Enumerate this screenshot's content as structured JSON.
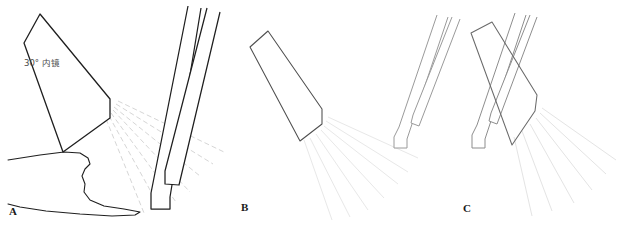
{
  "figure": {
    "background_color": "#ffffff",
    "width": 621,
    "height": 225,
    "ink_color_dark": "#1a1a1a",
    "ink_color_mid": "#5a5a5a",
    "ink_color_light": "#b9b9b9",
    "ray_color": "#d9d9d9",
    "ray_color_faint": "#e6e6e6"
  },
  "panels": {
    "a": {
      "label": "A",
      "annotation": "30° 内镜",
      "annotation_degree_value": "30",
      "annotation_unit": "°",
      "annotation_instrument": "内镜"
    },
    "b": {
      "label": "B"
    },
    "c": {
      "label": "C"
    }
  },
  "geometry": {
    "panel_a": {
      "endoscope_body": "M 40,14 L 110,100 L 110,118 L 62,152 L 24,43 Z",
      "endoscope_edge_left": "M 24,43 L 62,152",
      "endoscope_edge_right": "M 40,14 L 110,100",
      "endoscope_bevel": "M 110,100 L 110,118 L 62,152",
      "instrument_1": "M 188,8 L 150,193 L 150,209 L 168,209 L 168,196 L 200,10",
      "instrument_2": "M 206,10 L 164,172 L 164,183 L 178,184 L 218,14",
      "tissue_outline": "M 8,161 L 44,156 L 70,154 L 86,157 L 90,163 L 86,168 L 83,175 L 86,183 L 85,192 L 92,200 L 106,206 L 128,209 L 140,211 L 136,214 L 118,216 L 84,215 L 50,212 L 22,208 L 8,204",
      "rays": [
        "M 112,108 L 196,178",
        "M 112,110 L 186,192",
        "M 112,112 L 172,200",
        "M 112,114 L 158,206",
        "M 112,116 L 146,212",
        "M 115,106 L 210,166",
        "M 117,104 L 222,156"
      ]
    },
    "panel_b": {
      "endoscope_body": "M 268,31 L 322,110 L 322,125 L 300,140 L 250,47 Z",
      "rays": [
        "M 324,128 L 392,190",
        "M 322,130 L 380,200",
        "M 318,133 L 366,208",
        "M 312,136 L 350,214",
        "M 306,139 L 336,218",
        "M 326,124 L 402,176",
        "M 328,120 L 412,162"
      ]
    },
    "panel_c": {
      "instrument_left_1": "M 438,16 L 398,128 L 394,138 L 394,147 L 406,147 L 406,139 L 448,18",
      "instrument_left_2": "M 452,18 L 412,116 L 410,124 L 418,127 L 460,20",
      "instrument_right_1": "M 516,14 L 476,126 L 472,136 L 472,147 L 484,147 L 484,139 L 526,16",
      "instrument_right_2": "M 530,16 L 490,114 L 488,122 L 496,125 L 536,18",
      "endoscope_body": "M 492,22 L 536,96 L 534,112 L 512,144 L 472,34 Z",
      "rays": [
        "M 540,112 L 612,168",
        "M 538,116 L 600,180",
        "M 534,120 L 586,192",
        "M 528,125 L 568,202",
        "M 520,132 L 548,208",
        "M 542,106 L 618,152"
      ]
    }
  }
}
